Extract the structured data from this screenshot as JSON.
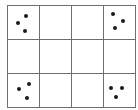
{
  "figure": {
    "name": "dot-grid-figure",
    "background_color": "#fdfdfd",
    "cell_background_color": "#ffffff",
    "line_color": "#6e6e6e",
    "dot_color": "#1a1a1a",
    "columns": 4,
    "rows": 3,
    "dot_size_px": 4,
    "total_dots": 12
  },
  "grid": {
    "rows": [
      {
        "row_index": 0,
        "cells": [
          {
            "cell_id": "r0c0",
            "dot_count": 3,
            "dots": [
              {
                "x_pct": 58,
                "y_pct": 30
              },
              {
                "x_pct": 32,
                "y_pct": 52
              },
              {
                "x_pct": 56,
                "y_pct": 76
              }
            ]
          },
          {
            "cell_id": "r0c1",
            "dot_count": 0,
            "dots": []
          },
          {
            "cell_id": "r0c2",
            "dot_count": 0,
            "dots": []
          },
          {
            "cell_id": "r0c3",
            "dot_count": 3,
            "dots": [
              {
                "x_pct": 28,
                "y_pct": 24
              },
              {
                "x_pct": 60,
                "y_pct": 46
              },
              {
                "x_pct": 34,
                "y_pct": 68
              }
            ]
          }
        ]
      },
      {
        "row_index": 1,
        "cells": [
          {
            "cell_id": "r1c0",
            "dot_count": 0,
            "dots": []
          },
          {
            "cell_id": "r1c1",
            "dot_count": 0,
            "dots": []
          },
          {
            "cell_id": "r1c2",
            "dot_count": 0,
            "dots": []
          },
          {
            "cell_id": "r1c3",
            "dot_count": 0,
            "dots": []
          }
        ]
      },
      {
        "row_index": 2,
        "cells": [
          {
            "cell_id": "r2c0",
            "dot_count": 3,
            "dots": [
              {
                "x_pct": 68,
                "y_pct": 30
              },
              {
                "x_pct": 34,
                "y_pct": 44
              },
              {
                "x_pct": 60,
                "y_pct": 74
              }
            ]
          },
          {
            "cell_id": "r2c1",
            "dot_count": 0,
            "dots": []
          },
          {
            "cell_id": "r2c2",
            "dot_count": 0,
            "dots": []
          },
          {
            "cell_id": "r2c3",
            "dot_count": 3,
            "dots": [
              {
                "x_pct": 24,
                "y_pct": 42
              },
              {
                "x_pct": 58,
                "y_pct": 42
              },
              {
                "x_pct": 40,
                "y_pct": 70
              }
            ]
          }
        ]
      }
    ]
  }
}
